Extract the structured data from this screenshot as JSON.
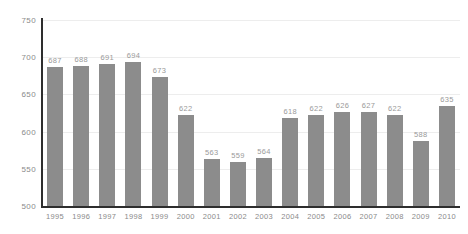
{
  "chart_data": {
    "type": "bar",
    "title": "",
    "subtitle": "",
    "xlabel": "",
    "ylabel": "",
    "categories": [
      "1995",
      "1996",
      "1997",
      "1998",
      "1999",
      "2000",
      "2001",
      "2002",
      "2003",
      "2004",
      "2005",
      "2006",
      "2007",
      "2008",
      "2009",
      "2010"
    ],
    "values": [
      687,
      688,
      691,
      694,
      673,
      622,
      563,
      559,
      564,
      618,
      622,
      626,
      627,
      622,
      588,
      635
    ],
    "data_labels": [
      "687",
      "688",
      "691",
      "694",
      "673",
      "622",
      "563",
      "559",
      "564",
      "618",
      "622",
      "626",
      "627",
      "622",
      "588",
      "635"
    ],
    "ylim": [
      500,
      750
    ],
    "y_ticks": [
      750,
      700,
      650,
      600,
      550,
      500
    ],
    "y_tick_labels": [
      "750",
      "700",
      "650",
      "600",
      "550",
      "500"
    ],
    "x_tick_labels": [
      "1995",
      "1996",
      "1997",
      "1998",
      "1999",
      "2000",
      "2001",
      "2002",
      "2003",
      "2004",
      "2005",
      "2006",
      "2007",
      "2008",
      "2009",
      "2010"
    ],
    "grid": true,
    "grid_axis": "y",
    "legend": false,
    "legend_position": "none",
    "annotations": [],
    "colors": {
      "bar": "#8c8c8c",
      "gridline": "#ededed",
      "axis_line": "#2e2e2e",
      "tick_label": "#8a8a8a",
      "data_label": "#9a9a9a",
      "background": "#ffffff"
    }
  }
}
